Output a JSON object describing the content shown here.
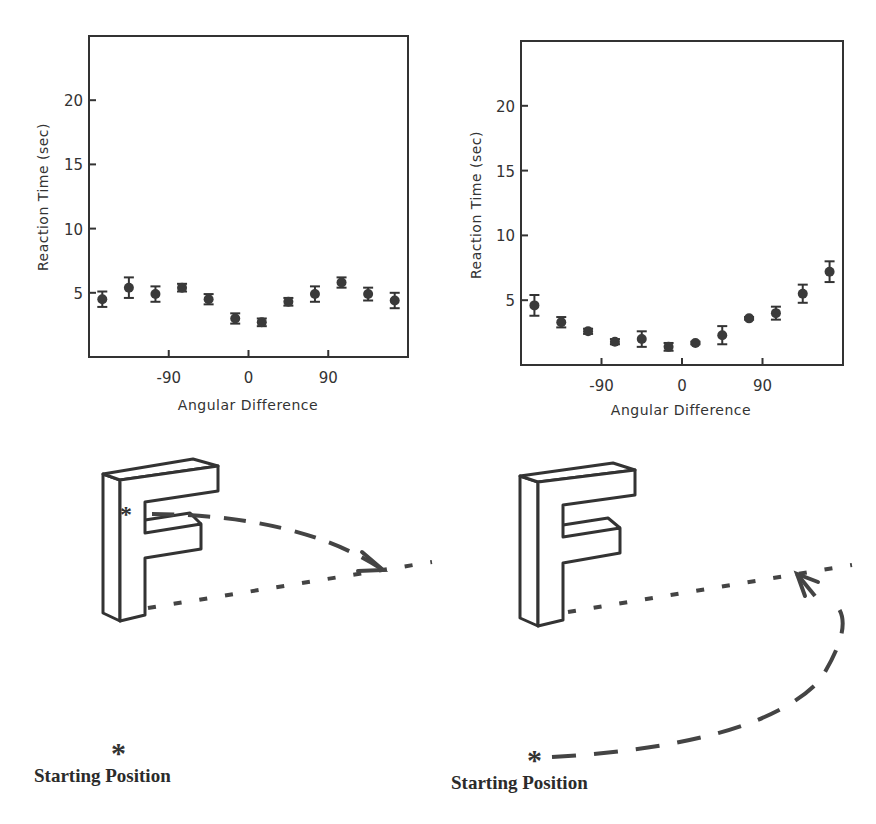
{
  "chart_data": [
    {
      "type": "scatter",
      "title": "",
      "xlabel": "Angular Difference",
      "ylabel": "Reaction Time (sec)",
      "xlim": [
        -180,
        180
      ],
      "ylim": [
        0,
        25
      ],
      "xticks": [
        -90,
        0,
        90
      ],
      "yticks": [
        5,
        10,
        15,
        20
      ],
      "grid": false,
      "error_bars": true,
      "x": [
        -165,
        -135,
        -105,
        -75,
        -45,
        -15,
        15,
        45,
        75,
        105,
        135,
        165
      ],
      "values": [
        4.5,
        5.4,
        4.9,
        5.4,
        4.5,
        3.0,
        2.7,
        4.3,
        4.9,
        5.8,
        4.9,
        4.4
      ],
      "errors": [
        0.6,
        0.8,
        0.6,
        0.3,
        0.4,
        0.4,
        0.3,
        0.3,
        0.6,
        0.4,
        0.5,
        0.6
      ],
      "caption": "Starting Position"
    },
    {
      "type": "scatter",
      "title": "",
      "xlabel": "Angular Difference",
      "ylabel": "Reaction Time (sec)",
      "xlim": [
        -180,
        180
      ],
      "ylim": [
        0,
        25
      ],
      "xticks": [
        -90,
        0,
        90
      ],
      "yticks": [
        5,
        10,
        15,
        20
      ],
      "grid": false,
      "error_bars": true,
      "x": [
        -165,
        -135,
        -105,
        -75,
        -45,
        -15,
        15,
        45,
        75,
        105,
        135,
        165
      ],
      "values": [
        4.6,
        3.3,
        2.6,
        1.8,
        2.0,
        1.4,
        1.7,
        2.3,
        3.6,
        4.0,
        5.5,
        7.2
      ],
      "errors": [
        0.8,
        0.4,
        0.2,
        0.2,
        0.6,
        0.3,
        0.1,
        0.7,
        0.1,
        0.5,
        0.7,
        0.8
      ],
      "caption": "Starting Position"
    }
  ],
  "panels": {
    "left": {
      "xlabel": "Angular Difference",
      "ylabel": "Reaction Time (sec)",
      "xtick_labels": [
        "-90",
        "0",
        "90"
      ],
      "ytick_labels": [
        "5",
        "10",
        "15",
        "20"
      ],
      "illustration": "letter-F-with-forward-arc",
      "star": "*",
      "caption": "Starting Position"
    },
    "right": {
      "xlabel": "Angular Difference",
      "ylabel": "Reaction Time (sec)",
      "xtick_labels": [
        "-90",
        "0",
        "90"
      ],
      "ytick_labels": [
        "5",
        "10",
        "15",
        "20"
      ],
      "illustration": "letter-F-with-sweeping-arc",
      "star": "*",
      "caption": "Starting Position"
    }
  },
  "colors": {
    "ink": "#333333",
    "background": "#ffffff"
  }
}
